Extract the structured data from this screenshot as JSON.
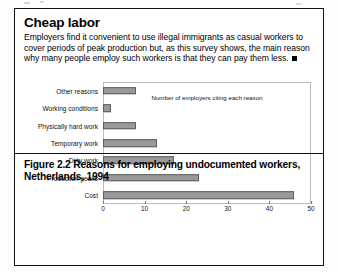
{
  "credit": "Vanckxe, C. and Groenendijk-Lighteim, J. 1994.",
  "article": {
    "headline": "Cheap labor",
    "body": "Employers find it convenient to use illegal immigrants as casual workers to cover periods of peak production but, as this survey shows, the main reason why many people employ such workers is that they can pay them less."
  },
  "caption": "Figure 2.2 Reasons for employing undocumented workers, Netherlands, 1994",
  "chart_data": {
    "type": "bar",
    "orientation": "horizontal",
    "title": "",
    "xlabel": "Number of employers citing each reason",
    "ylabel": "",
    "xlim": [
      0,
      50
    ],
    "xticks": [
      0,
      10,
      20,
      30,
      40,
      50
    ],
    "grid": false,
    "legend": "none",
    "categories": [
      "Other reasons",
      "Working conditions",
      "Physically hard work",
      "Temporary work",
      "Dirty work",
      "Production peaks",
      "Cost"
    ],
    "values": [
      8,
      2,
      8,
      13,
      17,
      23,
      46
    ],
    "bar_color": "#9a9a9a",
    "bar_border_color": "#5e5e5e"
  }
}
